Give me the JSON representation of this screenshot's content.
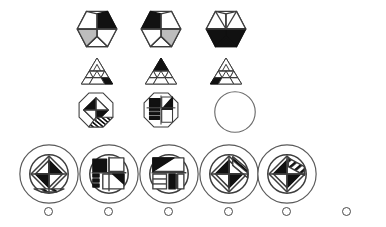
{
  "item": {
    "type": "matrix-reasoning",
    "title": "Matrix reasoning item",
    "instruction_text": "",
    "matrix": {
      "rows": 3,
      "cols": 3,
      "cells": [
        {
          "id": "cell-r1c1",
          "shape": "hexagon",
          "name": "hexagon-split-black-right",
          "filled": true,
          "description": "Hexagon divided into triangular wedges with solid black right wedge and grey hatched lower-left wedge"
        },
        {
          "id": "cell-r1c2",
          "shape": "hexagon",
          "name": "hexagon-split-black-left",
          "filled": true,
          "description": "Hexagon divided into triangular wedges with solid black upper-left wedge"
        },
        {
          "id": "cell-r1c3",
          "shape": "hexagon",
          "name": "hexagon-split-black-bottom",
          "filled": true,
          "description": "Hexagon divided into triangular wedges with solid black bottom band"
        },
        {
          "id": "cell-r2c1",
          "shape": "triangle",
          "name": "sierpinski-triangle-black-right",
          "filled": true,
          "description": "Subdivided triangle with black lower-right sub-triangle"
        },
        {
          "id": "cell-r2c2",
          "shape": "triangle",
          "name": "sierpinski-triangle-black-top",
          "filled": true,
          "description": "Subdivided triangle with black apex sub-triangle"
        },
        {
          "id": "cell-r2c3",
          "shape": "triangle",
          "name": "sierpinski-triangle-black-left",
          "filled": true,
          "description": "Subdivided triangle with black lower-left sub-triangle"
        },
        {
          "id": "cell-r3c1",
          "shape": "octagon",
          "name": "octagon-diamond-pattern",
          "filled": true,
          "description": "Octagon containing a diamond with black wedges and striped lower-right band"
        },
        {
          "id": "cell-r3c2",
          "shape": "octagon",
          "name": "octagon-block-pattern",
          "filled": true,
          "description": "Octagon containing rectangular blocks with black bar and striped segment"
        },
        {
          "id": "cell-r3c3",
          "shape": "circle",
          "name": "missing-answer-slot",
          "filled": false,
          "description": "Empty circle marking the missing element to be inferred"
        }
      ]
    },
    "answers": {
      "count": 6,
      "options": [
        {
          "id": "option-1",
          "label": "1",
          "name": "answer-option-1",
          "kind": "figure",
          "selected": false,
          "description": "Circle containing diamond with black left and right wedges and striped lower band"
        },
        {
          "id": "option-2",
          "label": "2",
          "name": "answer-option-2",
          "kind": "figure",
          "selected": false,
          "description": "Circle containing upright rectangular blocks with black top-left bar and striped segments"
        },
        {
          "id": "option-3",
          "label": "3",
          "name": "answer-option-3",
          "kind": "figure",
          "selected": false,
          "description": "Circle containing rectangular blocks with black upper-left wedge and striped lower-right block"
        },
        {
          "id": "option-4",
          "label": "4",
          "name": "answer-option-4",
          "kind": "figure",
          "selected": false,
          "description": "Circle containing tilted diamond with black band and striped wedge"
        },
        {
          "id": "option-5",
          "label": "5",
          "name": "answer-option-5",
          "kind": "figure",
          "selected": false,
          "description": "Circle containing diamond with black wedges and striped upper-right band"
        },
        {
          "id": "option-6",
          "label": "I don’t\nknow",
          "name": "answer-option-i-dont-know",
          "kind": "text",
          "selected": false,
          "description": "Text-only opt-out response"
        }
      ]
    }
  },
  "colors": {
    "background": "#ffffff",
    "ink": "#1a1a1a",
    "outline": "#3d3d3d",
    "fill_black": "#111111",
    "fill_grey": "#9a9a9a",
    "fill_white": "#ffffff",
    "radio_border": "#4a4a4a",
    "text": "#2b2b2b"
  }
}
